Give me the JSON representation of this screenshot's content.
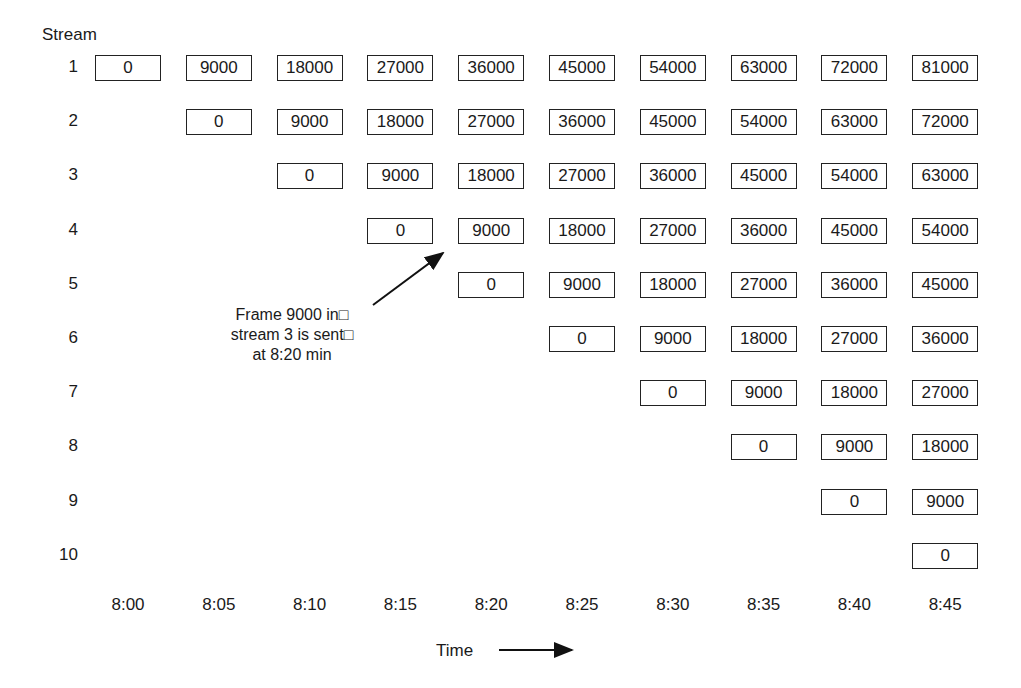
{
  "title_axis_y": "Stream",
  "xlabel": "Time",
  "annotation": {
    "lines": [
      "Frame 9000 in□",
      "stream 3 is sent□",
      "at 8:20 min"
    ]
  },
  "chart_data": {
    "type": "table",
    "title": "",
    "ylabel": "Stream",
    "xlabel": "Time",
    "x_ticks": [
      "8:00",
      "8:05",
      "8:10",
      "8:15",
      "8:20",
      "8:25",
      "8:30",
      "8:35",
      "8:40",
      "8:45"
    ],
    "streams": [
      {
        "stream": 1,
        "start_col": 0,
        "frames": [
          0,
          9000,
          18000,
          27000,
          36000,
          45000,
          54000,
          63000,
          72000,
          81000
        ]
      },
      {
        "stream": 2,
        "start_col": 1,
        "frames": [
          0,
          9000,
          18000,
          27000,
          36000,
          45000,
          54000,
          63000,
          72000
        ]
      },
      {
        "stream": 3,
        "start_col": 2,
        "frames": [
          0,
          9000,
          18000,
          27000,
          36000,
          45000,
          54000,
          63000
        ]
      },
      {
        "stream": 4,
        "start_col": 3,
        "frames": [
          0,
          9000,
          18000,
          27000,
          36000,
          45000,
          54000
        ]
      },
      {
        "stream": 5,
        "start_col": 4,
        "frames": [
          0,
          9000,
          18000,
          27000,
          36000,
          45000
        ]
      },
      {
        "stream": 6,
        "start_col": 5,
        "frames": [
          0,
          9000,
          18000,
          27000,
          36000
        ]
      },
      {
        "stream": 7,
        "start_col": 6,
        "frames": [
          0,
          9000,
          18000,
          27000
        ]
      },
      {
        "stream": 8,
        "start_col": 7,
        "frames": [
          0,
          9000,
          18000
        ]
      },
      {
        "stream": 9,
        "start_col": 8,
        "frames": [
          0,
          9000
        ]
      },
      {
        "stream": 10,
        "start_col": 9,
        "frames": [
          0
        ]
      }
    ],
    "annotations": [
      {
        "text": "Frame 9000 in stream 3 is sent at 8:20 min",
        "arrow_to": {
          "stream": 4,
          "time": "8:20"
        }
      }
    ]
  }
}
